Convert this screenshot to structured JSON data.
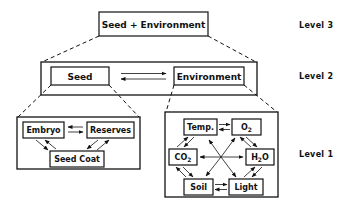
{
  "levels": {
    "level3": "Level 3",
    "level2": "Level 2",
    "level1": "Level 1"
  },
  "level3": {
    "box": "Seed + Environment"
  },
  "level2": {
    "seed": "Seed",
    "environment": "Environment",
    "relation": "bidirectional"
  },
  "level1": {
    "seed_components": {
      "embryo": "Embryo",
      "reserves": "Reserves",
      "seed_coat": "Seed Coat"
    },
    "environment_components": {
      "temp": "Temp.",
      "o2": "O",
      "o2_sub": "2",
      "co2": "CO",
      "co2_sub": "2",
      "h2o_h": "H",
      "h2o_sub": "2",
      "h2o_o": "O",
      "soil": "Soil",
      "light": "Light"
    }
  },
  "colors": {
    "ink": "#111111",
    "background": "#ffffff"
  }
}
